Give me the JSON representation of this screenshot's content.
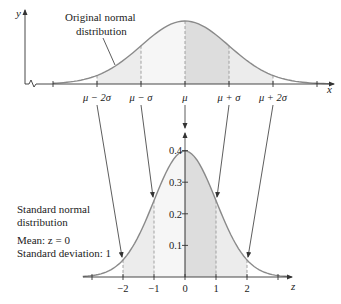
{
  "top_chart": {
    "title": "Original normal distribution",
    "title_line1": "Original normal",
    "title_line2": "distribution",
    "y_axis_label": "y",
    "x_axis_label": "x",
    "tick_labels": [
      "μ − 2σ",
      "μ − σ",
      "μ",
      "μ + σ",
      "μ + 2σ"
    ]
  },
  "bottom_chart": {
    "title_line1": "Standard normal",
    "title_line2": "distribution",
    "mean_label": "Mean: z = 0",
    "sd_label": "Standard deviation: 1",
    "x_axis_label": "z",
    "x_tick_labels": [
      "−2",
      "−1",
      "0",
      "1",
      "2"
    ],
    "y_tick_labels": [
      "0.1",
      "0.2",
      "0.3",
      "0.4"
    ]
  },
  "colors": {
    "curve": "#8a8a8a",
    "axis": "#333333",
    "shade_outer": "#ececec",
    "shade_inner_left": "#f5f5f5",
    "shade_inner_right": "#dcdcdc",
    "dashed": "#999999"
  },
  "chart_data": {
    "type": "line",
    "series": [
      {
        "name": "Original normal distribution",
        "x_labels": [
          "μ-2σ",
          "μ-σ",
          "μ",
          "μ+σ",
          "μ+2σ"
        ],
        "xlabel": "x",
        "ylabel": "y"
      },
      {
        "name": "Standard normal distribution",
        "x": [
          -2,
          -1,
          0,
          1,
          2
        ],
        "y": [
          0.054,
          0.242,
          0.399,
          0.242,
          0.054
        ],
        "xlabel": "z",
        "ylabel": "",
        "yticks": [
          0.1,
          0.2,
          0.3,
          0.4
        ],
        "mean": 0,
        "sd": 1
      }
    ],
    "annotations": [
      "Mean: z = 0",
      "Standard deviation: 1"
    ]
  }
}
